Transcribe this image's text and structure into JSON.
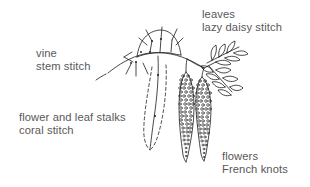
{
  "figure": {
    "background_color": "#ffffff",
    "ink_color": "#1a1a1a",
    "text_color": "#58585a"
  },
  "labels": {
    "leaves": {
      "line1": "leaves",
      "line2": "lazy daisy stitch"
    },
    "vine": {
      "line1": "vine",
      "line2": "stem stitch"
    },
    "stalks": {
      "line1": "flower and leaf stalks",
      "line2": "coral stitch"
    },
    "flowers": {
      "line1": "flowers",
      "line2": "French knots"
    }
  },
  "drawing": {
    "elements": [
      "vine-stem-curve",
      "dome-arc-with-radiating-stitch-ticks",
      "dashed-outline-catkin",
      "french-knot-catkin-left",
      "french-knot-catkin-right",
      "leaf-sprig-upper",
      "leaf-sprig-lower"
    ]
  }
}
